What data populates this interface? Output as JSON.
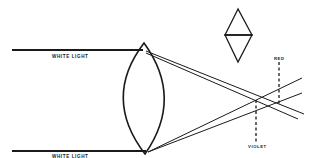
{
  "diagram": {
    "labels": {
      "top_incident": "WHITE LIGHT",
      "bottom_incident": "WHITE LIGHT",
      "red_focus": "RED",
      "violet_focus": "VIOLET"
    },
    "elements": {
      "lens": "biconvex lens",
      "prisms": "two prisms base to base",
      "incident_rays": 2,
      "refracted_rays": 4,
      "focal_points": [
        "violet (nearer lens)",
        "red (farther from lens)"
      ]
    },
    "colors": {
      "ink": "#1a1a1a",
      "background": "#ffffff"
    }
  }
}
